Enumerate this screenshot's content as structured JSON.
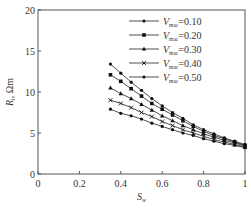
{
  "chart_data": {
    "type": "line",
    "title": "",
    "xlabel": "S_w",
    "ylabel": "R_t, Ωm",
    "xlim": [
      0,
      1
    ],
    "ylim": [
      0,
      20
    ],
    "xticks": [
      "0",
      "0.2",
      "0.4",
      "0.6",
      "0.8",
      "1"
    ],
    "yticks": [
      "0",
      "5",
      "10",
      "15",
      "20"
    ],
    "grid": false,
    "legend_position": "upper right",
    "x": [
      0.35,
      0.4,
      0.45,
      0.5,
      0.55,
      0.6,
      0.65,
      0.7,
      0.75,
      0.8,
      0.85,
      0.9,
      0.95,
      1.0
    ],
    "series": [
      {
        "name": "V_mac=0.10",
        "marker": "dot",
        "values": [
          13.4,
          12.3,
          11.2,
          10.2,
          9.2,
          8.3,
          7.5,
          6.8,
          6.0,
          5.4,
          4.9,
          4.4,
          4.0,
          3.6
        ]
      },
      {
        "name": "V_mac=0.20",
        "marker": "square",
        "values": [
          12.1,
          11.3,
          10.4,
          9.5,
          8.6,
          7.9,
          7.2,
          6.5,
          5.8,
          5.2,
          4.7,
          4.3,
          3.9,
          3.5
        ]
      },
      {
        "name": "V_mac=0.30",
        "marker": "triangle",
        "values": [
          10.5,
          9.8,
          9.2,
          8.5,
          7.8,
          7.1,
          6.5,
          5.9,
          5.4,
          4.9,
          4.5,
          4.1,
          3.8,
          3.4
        ]
      },
      {
        "name": "V_mac=0.40",
        "marker": "x",
        "values": [
          9.0,
          8.6,
          8.1,
          7.5,
          7.0,
          6.4,
          5.9,
          5.4,
          5.0,
          4.6,
          4.2,
          3.9,
          3.6,
          3.3
        ]
      },
      {
        "name": "V_mac=0.50",
        "marker": "dot",
        "values": [
          7.9,
          7.4,
          7.1,
          6.7,
          6.2,
          5.8,
          5.4,
          5.0,
          4.7,
          4.3,
          4.0,
          3.7,
          3.5,
          3.2
        ]
      }
    ]
  },
  "legend": {
    "items": [
      {
        "label": "V",
        "sub": "mac",
        "value": "=0.10"
      },
      {
        "label": "V",
        "sub": "mac",
        "value": "=0.20"
      },
      {
        "label": "V",
        "sub": "mac",
        "value": "=0.30"
      },
      {
        "label": "V",
        "sub": "mac",
        "value": "=0.40"
      },
      {
        "label": "V",
        "sub": "mac",
        "value": "=0.50"
      }
    ]
  },
  "axes": {
    "x_label_main": "S",
    "x_label_sub": "w",
    "y_label_main": "R",
    "y_label_sub": "t",
    "y_label_rest": ",  Ωm"
  }
}
